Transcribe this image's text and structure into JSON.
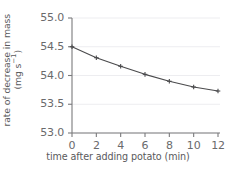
{
  "chart_data": {
    "type": "line",
    "title": "",
    "xlabel": "time after adding potato (min)",
    "ylabel": "rate of decrease in mass (mg s⁻¹)",
    "ylabel_line1": "rate of decrease in mass",
    "ylabel_line2_prefix": "(mg s",
    "ylabel_line2_sup": "−1",
    "ylabel_line2_suffix": ")",
    "x": [
      0,
      2,
      4,
      6,
      8,
      10,
      12
    ],
    "values": [
      54.5,
      54.31,
      54.16,
      54.02,
      53.9,
      53.8,
      53.73
    ],
    "xlim": [
      0,
      12
    ],
    "ylim": [
      53.0,
      55.0
    ],
    "xticks": [
      0,
      2,
      4,
      6,
      8,
      10,
      12
    ],
    "xtick_labels": [
      "0",
      "2",
      "4",
      "6",
      "8",
      "10",
      "12"
    ],
    "yticks": [
      53.0,
      53.5,
      54.0,
      54.5,
      55.0
    ],
    "ytick_labels": [
      "53.0",
      "53.5",
      "54.0",
      "54.5",
      "55.0"
    ],
    "grid": "horizontal",
    "legend": "none",
    "marker": "plus",
    "line_color": "#4a4a4c",
    "grid_color": "#ededf0",
    "axis_color": "#7a7a7c",
    "text_color": "#5a5a5c"
  }
}
